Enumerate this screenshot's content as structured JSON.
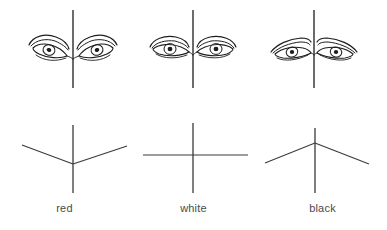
{
  "figure": {
    "background_color": "#ffffff",
    "ink_color": "#1d1d1d",
    "line_color": "#3a3a3a",
    "label_color": "#4a4a4a"
  },
  "columns": [
    {
      "id": "red",
      "label": "red",
      "eye_axis": "downward-slanting",
      "diagram_shape": "v-shape",
      "midline_x": 73,
      "midline_top": 10,
      "midline_bottom": 88,
      "diagram": {
        "vertical": {
          "x": 73,
          "y1": 125,
          "y2": 193
        },
        "left_arm": {
          "x1": 22,
          "y1": 145,
          "x2": 73,
          "y2": 164
        },
        "right_arm": {
          "x1": 73,
          "y1": 164,
          "x2": 127,
          "y2": 146
        }
      }
    },
    {
      "id": "white",
      "label": "white",
      "eye_axis": "horizontal",
      "diagram_shape": "cross",
      "midline_x": 193,
      "midline_top": 10,
      "midline_bottom": 88,
      "diagram": {
        "vertical": {
          "x": 193,
          "y1": 123,
          "y2": 193
        },
        "left_arm": {
          "x1": 143,
          "y1": 155,
          "x2": 193,
          "y2": 155
        },
        "right_arm": {
          "x1": 193,
          "y1": 155,
          "x2": 248,
          "y2": 155
        }
      }
    },
    {
      "id": "black",
      "label": "black",
      "eye_axis": "upward-slanting",
      "diagram_shape": "inverted-v-shape",
      "midline_x": 314,
      "midline_top": 10,
      "midline_bottom": 88,
      "diagram": {
        "vertical": {
          "x": 315,
          "y1": 128,
          "y2": 193
        },
        "left_arm": {
          "x1": 265,
          "y1": 163,
          "x2": 315,
          "y2": 143
        },
        "right_arm": {
          "x1": 315,
          "y1": 143,
          "x2": 369,
          "y2": 164
        }
      }
    }
  ],
  "labels": {
    "red": "red",
    "white": "white",
    "black": "black"
  }
}
